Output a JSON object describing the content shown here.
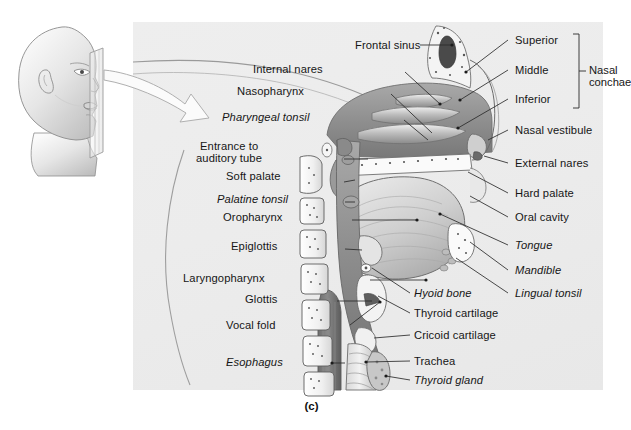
{
  "figure": {
    "caption": "(c)",
    "panel_bg": "#ececec",
    "line_color": "#2a2a2a",
    "text_color": "#161616"
  },
  "inset": {
    "name": "head-profile-with-sagittal-plane",
    "description": "Lateral view of a human head with a vertical sagittal section plane and a curved arrow pointing to the enlarged section"
  },
  "labels_left": [
    {
      "text": "Internal nares",
      "italic": false,
      "x": 341,
      "y": 69,
      "lx": 345,
      "ly": 73,
      "tx": 398,
      "ty": 104
    },
    {
      "text": "Nasopharynx",
      "italic": false,
      "x": 327,
      "y": 91,
      "lx": 331,
      "ly": 95,
      "tx": 392,
      "ty": 136
    },
    {
      "text": "Pharyngeal tonsil",
      "italic": true,
      "x": 337,
      "y": 117,
      "lx": 341,
      "ly": 121,
      "tx": 386,
      "ty": 140
    },
    {
      "text": "Entrance to",
      "italic": false,
      "x": 298,
      "y": 146,
      "lx": 303,
      "ly": 160,
      "tx": 435,
      "ty": 159
    },
    {
      "text": "auditory tube",
      "italic": false,
      "x": 302,
      "y": 158,
      "lx": 0,
      "ly": 0,
      "tx": 0,
      "ty": 0
    },
    {
      "text": "Soft palate",
      "italic": false,
      "x": 295,
      "y": 176,
      "lx": 299,
      "ly": 180,
      "tx": 430,
      "ty": 189
    },
    {
      "text": "Palatine tonsil",
      "italic": true,
      "x": 294,
      "y": 199,
      "lx": 298,
      "ly": 203,
      "tx": 427,
      "ty": 203
    },
    {
      "text": "Oropharynx",
      "italic": false,
      "x": 293,
      "y": 216,
      "lx": 297,
      "ly": 220,
      "tx": 420,
      "ty": 220
    },
    {
      "text": "Epiglottis",
      "italic": false,
      "x": 290,
      "y": 245,
      "lx": 294,
      "ly": 249,
      "tx": 438,
      "ty": 245
    },
    {
      "text": "Laryngopharynx",
      "italic": false,
      "x": 281,
      "y": 276,
      "lx": 285,
      "ly": 280,
      "tx": 420,
      "ty": 280
    },
    {
      "text": "Glottis",
      "italic": false,
      "x": 287,
      "y": 297,
      "lx": 291,
      "ly": 301,
      "tx": 440,
      "ty": 300
    },
    {
      "text": "Vocal fold",
      "italic": false,
      "x": 288,
      "y": 324,
      "lx": 292,
      "ly": 328,
      "tx": 445,
      "ty": 297
    },
    {
      "text": "Esophagus",
      "italic": true,
      "x": 288,
      "y": 360,
      "lx": 292,
      "ly": 364,
      "tx": 422,
      "ty": 363
    }
  ],
  "labels_top": [
    {
      "text": "Frontal sinus",
      "italic": false,
      "x": 423,
      "y": 45,
      "lx": 418,
      "ly": 49,
      "tx": 450,
      "ty": 49
    }
  ],
  "labels_right": [
    {
      "text": "Superior",
      "italic": false,
      "x": 512,
      "y": 40,
      "lx": 508,
      "ly": 44,
      "tx": 469,
      "ty": 78
    },
    {
      "text": "Middle",
      "italic": false,
      "x": 512,
      "y": 70,
      "lx": 508,
      "ly": 74,
      "tx": 460,
      "ty": 103
    },
    {
      "text": "Inferior",
      "italic": false,
      "x": 512,
      "y": 99,
      "lx": 508,
      "ly": 103,
      "tx": 455,
      "ty": 133
    },
    {
      "text": "Nasal vestibule",
      "italic": false,
      "x": 512,
      "y": 130,
      "lx": 508,
      "ly": 134,
      "tx": 487,
      "ty": 140
    },
    {
      "text": "External nares",
      "italic": false,
      "x": 512,
      "y": 163,
      "lx": 508,
      "ly": 167,
      "tx": 487,
      "ty": 157
    },
    {
      "text": "Hard palate",
      "italic": false,
      "x": 512,
      "y": 193,
      "lx": 508,
      "ly": 197,
      "tx": 463,
      "ty": 178
    },
    {
      "text": "Oral cavity",
      "italic": false,
      "x": 512,
      "y": 217,
      "lx": 508,
      "ly": 221,
      "tx": 462,
      "ty": 202
    },
    {
      "text": "Tongue",
      "italic": true,
      "x": 512,
      "y": 245,
      "lx": 508,
      "ly": 249,
      "tx": 437,
      "ty": 215
    },
    {
      "text": "Mandible",
      "italic": true,
      "x": 512,
      "y": 270,
      "lx": 508,
      "ly": 274,
      "tx": 462,
      "ty": 238
    },
    {
      "text": "Lingual tonsil",
      "italic": true,
      "x": 512,
      "y": 293,
      "lx": 508,
      "ly": 297,
      "tx": 458,
      "ty": 258
    }
  ],
  "labels_lower_right": [
    {
      "text": "Hyoid bone",
      "italic": true,
      "x": 414,
      "y": 293,
      "lx": 410,
      "ly": 297,
      "tx": 383,
      "ty": 268
    },
    {
      "text": "Thyroid cartilage",
      "italic": false,
      "x": 414,
      "y": 313,
      "lx": 410,
      "ly": 317,
      "tx": 366,
      "ty": 300
    },
    {
      "text": "Cricoid cartilage",
      "italic": false,
      "x": 414,
      "y": 335,
      "lx": 410,
      "ly": 339,
      "tx": 362,
      "ty": 337
    },
    {
      "text": "Trachea",
      "italic": false,
      "x": 414,
      "y": 361,
      "lx": 410,
      "ly": 365,
      "tx": 358,
      "ty": 362
    },
    {
      "text": "Thyroid gland",
      "italic": true,
      "x": 414,
      "y": 380,
      "lx": 410,
      "ly": 384,
      "tx": 367,
      "ty": 380
    }
  ],
  "brace": {
    "label_line1": "Nasal",
    "label_line2": "conchae",
    "x": 590,
    "y_top": 34,
    "y_bottom": 108
  }
}
